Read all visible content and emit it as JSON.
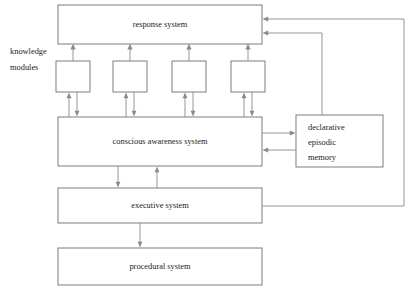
{
  "diagram": {
    "style": {
      "background": "#ffffff",
      "box_stroke": "#6f6f6f",
      "box_fill": "#ffffff",
      "connector_stroke": "#8a8a8a",
      "text_color": "#1a1a1a"
    },
    "nodes": [
      {
        "id": "response",
        "label": "response system",
        "x": 58,
        "y": 5,
        "w": 204,
        "h": 39
      },
      {
        "id": "module1",
        "label": "",
        "x": 56,
        "y": 61,
        "w": 34,
        "h": 31
      },
      {
        "id": "module2",
        "label": "",
        "x": 113,
        "y": 61,
        "w": 34,
        "h": 31
      },
      {
        "id": "module3",
        "label": "",
        "x": 172,
        "y": 61,
        "w": 34,
        "h": 31
      },
      {
        "id": "module4",
        "label": "",
        "x": 231,
        "y": 61,
        "w": 34,
        "h": 31
      },
      {
        "id": "conscious",
        "label": "conscious awareness system",
        "x": 58,
        "y": 117,
        "w": 204,
        "h": 49
      },
      {
        "id": "memory",
        "label": "",
        "x": 296,
        "y": 115,
        "w": 87,
        "h": 52
      },
      {
        "id": "executive",
        "label": "executive system",
        "x": 58,
        "y": 188,
        "w": 204,
        "h": 35
      },
      {
        "id": "procedural",
        "label": "procedural system",
        "x": 58,
        "y": 248,
        "w": 204,
        "h": 37
      }
    ],
    "free_labels": [
      {
        "id": "knowledge-modules-line1",
        "text": "knowledge",
        "x": 10,
        "y": 48
      },
      {
        "id": "knowledge-modules-line2",
        "text": "modules",
        "x": 10,
        "y": 62
      }
    ],
    "memory_lines": [
      {
        "id": "memory-line-1",
        "text": "declarative"
      },
      {
        "id": "memory-line-2",
        "text": "episodic"
      },
      {
        "id": "memory-line-3",
        "text": "memory"
      }
    ],
    "edges": [
      {
        "id": "module1-to-response",
        "from": "module1",
        "to": "response",
        "kind": "arrow-up"
      },
      {
        "id": "module2-to-response",
        "from": "module2",
        "to": "response",
        "kind": "arrow-up"
      },
      {
        "id": "module3-to-response",
        "from": "module3",
        "to": "response",
        "kind": "arrow-up"
      },
      {
        "id": "module4-to-response",
        "from": "module4",
        "to": "response",
        "kind": "arrow-up"
      },
      {
        "id": "conscious-module1",
        "from": "conscious",
        "to": "module1",
        "kind": "bidirectional"
      },
      {
        "id": "conscious-module2",
        "from": "conscious",
        "to": "module2",
        "kind": "bidirectional"
      },
      {
        "id": "conscious-module3",
        "from": "conscious",
        "to": "module3",
        "kind": "bidirectional"
      },
      {
        "id": "conscious-module4",
        "from": "conscious",
        "to": "module4",
        "kind": "bidirectional"
      },
      {
        "id": "conscious-to-memory",
        "from": "conscious",
        "to": "memory",
        "kind": "arrow-right"
      },
      {
        "id": "memory-to-conscious",
        "from": "memory",
        "to": "conscious",
        "kind": "arrow-left"
      },
      {
        "id": "conscious-to-executive",
        "from": "conscious",
        "to": "executive",
        "kind": "arrow-down"
      },
      {
        "id": "executive-to-conscious",
        "from": "executive",
        "to": "conscious",
        "kind": "arrow-up"
      },
      {
        "id": "executive-to-procedural",
        "from": "executive",
        "to": "procedural",
        "kind": "arrow-down"
      },
      {
        "id": "memory-to-response",
        "from": "memory",
        "to": "response",
        "kind": "routed-arrow"
      },
      {
        "id": "executive-to-response",
        "from": "executive",
        "to": "response",
        "kind": "routed-arrow"
      }
    ]
  }
}
